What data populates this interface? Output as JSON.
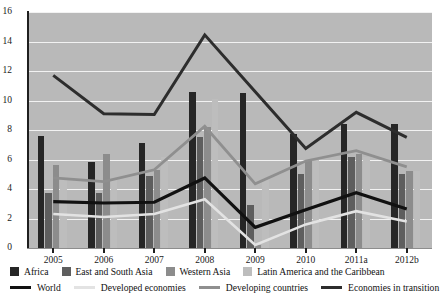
{
  "chart_data": {
    "type": "bar",
    "title": "",
    "xlabel": "",
    "ylabel": "",
    "ylim": [
      0,
      16
    ],
    "ytick_step": 2,
    "yticks": [
      "0",
      "2",
      "4",
      "6",
      "8",
      "10",
      "12",
      "14",
      "16"
    ],
    "grid": true,
    "legend_position": "bottom",
    "categories": [
      "2005",
      "2006",
      "2007",
      "2008",
      "2009",
      "2010",
      "2011a",
      "2012b"
    ],
    "bar_series": [
      {
        "name": "Africa",
        "color": "#262626",
        "values": [
          7.6,
          5.85,
          7.1,
          10.6,
          10.5,
          7.7,
          8.4,
          8.4
        ]
      },
      {
        "name": "East and South Asia",
        "color": "#5e5e5e",
        "values": [
          3.7,
          3.7,
          4.9,
          7.5,
          2.9,
          5.0,
          6.2,
          5.0
        ]
      },
      {
        "name": "Western Asia",
        "color": "#8c8c8c",
        "values": [
          5.6,
          6.4,
          5.3,
          8.2,
          0.2,
          6.0,
          6.4,
          5.2
        ]
      },
      {
        "name": "Latin America and the Caribbean",
        "color": "#bdbdbd",
        "values": [
          4.7,
          4.6,
          6.2,
          10.1,
          4.7,
          6.0,
          6.2,
          5.2
        ]
      }
    ],
    "line_series": [
      {
        "name": "World",
        "color": "#111111",
        "width": 3.2,
        "values": [
          3.15,
          3.05,
          3.1,
          4.75,
          1.4,
          2.6,
          3.75,
          2.65
        ]
      },
      {
        "name": "Developed economies",
        "color": "#e3e3e3",
        "width": 2.6,
        "values": [
          2.3,
          2.1,
          2.3,
          3.3,
          0.2,
          1.6,
          2.5,
          1.8
        ]
      },
      {
        "name": "Developing countries",
        "color": "#8f8f8f",
        "width": 2.8,
        "values": [
          4.75,
          4.5,
          5.3,
          8.25,
          4.35,
          5.9,
          6.6,
          5.5
        ]
      },
      {
        "name": "Economies in transition",
        "color": "#2d2d2d",
        "width": 3.0,
        "values": [
          11.7,
          9.1,
          9.05,
          14.45,
          10.6,
          6.75,
          9.2,
          7.5
        ]
      }
    ]
  },
  "axis": {
    "y_title": "",
    "x_title": ""
  },
  "legend": {
    "bars": [
      {
        "label": "Africa",
        "icon": "legend-swatch-square"
      },
      {
        "label": "East and South Asia",
        "icon": "legend-swatch-square"
      },
      {
        "label": "Western Asia",
        "icon": "legend-swatch-square"
      },
      {
        "label": "Latin America and the Caribbean",
        "icon": "legend-swatch-square"
      }
    ],
    "lines": [
      {
        "label": "World",
        "icon": "legend-swatch-line"
      },
      {
        "label": "Developed economies",
        "icon": "legend-swatch-line"
      },
      {
        "label": "Developing countries",
        "icon": "legend-swatch-line"
      },
      {
        "label": "Economies in transition",
        "icon": "legend-swatch-line"
      }
    ]
  },
  "colors": {
    "plot_background": "#b9b9b9",
    "gridline": "#f2f2f2",
    "axis": "#1f1f1f",
    "page_background": "#ffffff"
  }
}
